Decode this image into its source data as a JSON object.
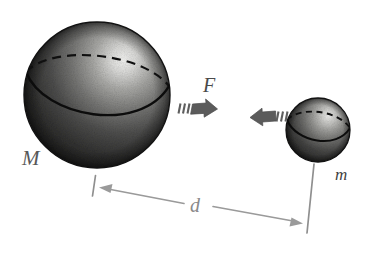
{
  "figure": {
    "background_color": "#ffffff"
  },
  "labels": {
    "large_mass": "M",
    "small_mass": "m",
    "force": "F",
    "distance": "d"
  },
  "bodies": [
    {
      "name": "large-sphere",
      "label": "M",
      "center_x": 97,
      "center_y": 95,
      "radius": 73,
      "surface_color": "#3a3a3a",
      "highlight_color": "#e8e8e6",
      "shadow_color": "#141414"
    },
    {
      "name": "small-sphere",
      "label": "m",
      "center_x": 318,
      "center_y": 130,
      "radius": 32,
      "surface_color": "#3a3a3a",
      "highlight_color": "#e2e2e0",
      "shadow_color": "#141414"
    }
  ],
  "arrows": [
    {
      "name": "force-arrow-right",
      "direction": "right",
      "label": "F",
      "color": "#5e5e5e",
      "motion_marks": 3
    },
    {
      "name": "force-arrow-left",
      "direction": "left",
      "label": "F",
      "color": "#5e5e5e",
      "motion_marks": 3
    }
  ],
  "dimension": {
    "name": "distance-dimension",
    "label": "d",
    "color": "#9a9a9a",
    "style": "double-headed-arrow",
    "from_body": "M",
    "to_body": "m"
  },
  "colors": {
    "ink": "#4a4a4a",
    "arrow_gray": "#5e5e5e",
    "dimension_gray": "#9a9a9a",
    "sphere_dark": "#2c2c2c",
    "page_white": "#ffffff"
  }
}
